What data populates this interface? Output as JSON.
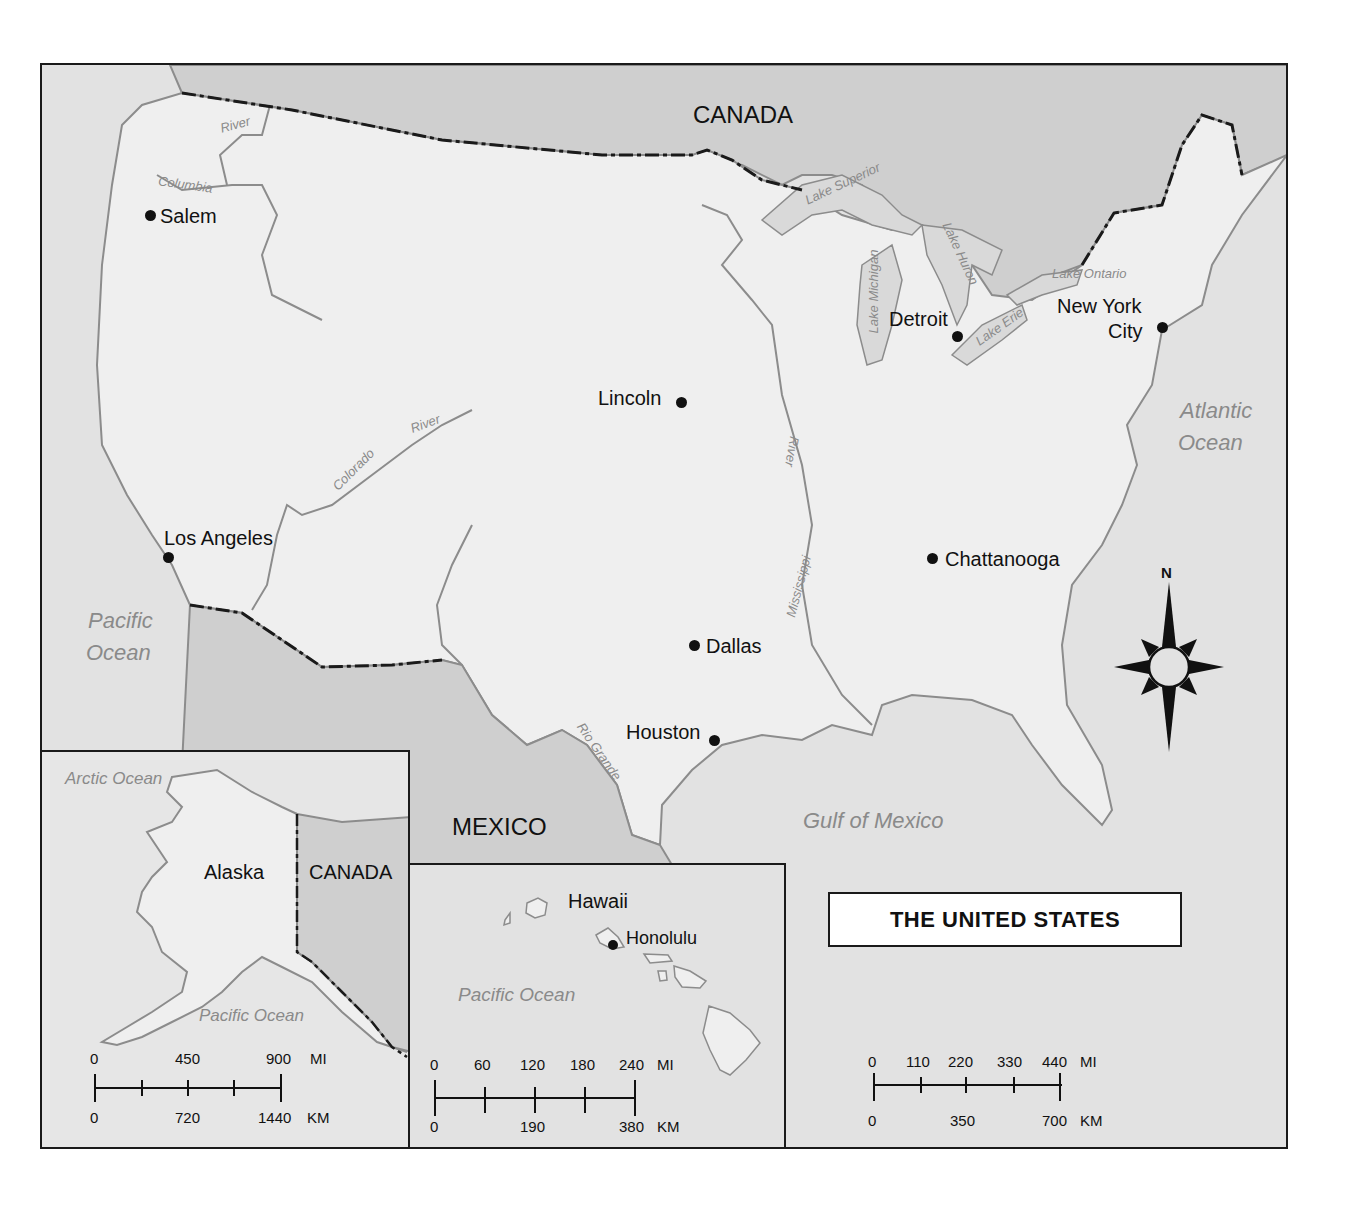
{
  "title": "THE UNITED STATES",
  "colors": {
    "land_us": "#efefef",
    "land_foreign": "#cfcfcf",
    "water": "#e2e2e2",
    "coastline": "#8c8c8c",
    "border": "#1a1a1a",
    "label_water": "#8a8a8a"
  },
  "countries": {
    "canada": "CANADA",
    "mexico": "MEXICO"
  },
  "cities": [
    {
      "name": "Salem"
    },
    {
      "name": "Los Angeles"
    },
    {
      "name": "Lincoln"
    },
    {
      "name": "Dallas"
    },
    {
      "name": "Houston"
    },
    {
      "name": "Detroit"
    },
    {
      "name": "New York",
      "name2": "City"
    },
    {
      "name": "Chattanooga"
    }
  ],
  "water_bodies": {
    "pacific_line1": "Pacific",
    "pacific_line2": "Ocean",
    "atlantic_line1": "Atlantic",
    "atlantic_line2": "Ocean",
    "gulf": "Gulf of Mexico"
  },
  "lakes": {
    "superior": "Lake Superior",
    "michigan": "Lake Michigan",
    "huron": "Lake Huron",
    "erie": "Lake Erie",
    "ontario": "Lake Ontario"
  },
  "rivers": {
    "columbia_1": "River",
    "columbia_2": "Columbia",
    "colorado_1": "Colorado",
    "colorado_2": "River",
    "mississippi_1": "River",
    "mississippi_2": "Mississippi",
    "rio_grande": "Rio Grande"
  },
  "compass": {
    "north_label": "N"
  },
  "insets": {
    "alaska": {
      "label": "Alaska",
      "neighbor": "CANADA",
      "ocean_north": "Arctic Ocean",
      "ocean_south": "Pacific Ocean",
      "scale": {
        "mi_ticks": [
          "0",
          "450",
          "900"
        ],
        "mi_unit": "MI",
        "km_ticks": [
          "0",
          "720",
          "1440"
        ],
        "km_unit": "KM"
      }
    },
    "hawaii": {
      "label": "Hawaii",
      "city": "Honolulu",
      "ocean": "Pacific Ocean",
      "scale": {
        "mi_ticks": [
          "0",
          "60",
          "120",
          "180",
          "240"
        ],
        "mi_unit": "MI",
        "km_ticks": [
          "0",
          "190",
          "380"
        ],
        "km_unit": "KM"
      }
    }
  },
  "main_scale": {
    "mi_ticks": [
      "0",
      "110",
      "220",
      "330",
      "440"
    ],
    "mi_unit": "MI",
    "km_ticks": [
      "0",
      "350",
      "700"
    ],
    "km_unit": "KM"
  }
}
